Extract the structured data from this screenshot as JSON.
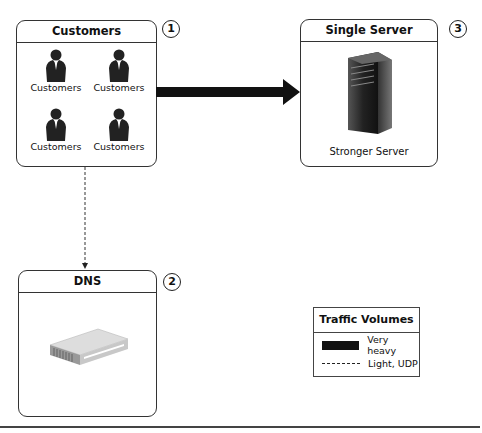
{
  "customers_box": {
    "title": "Customers",
    "badge": "1",
    "items": [
      {
        "label": "Customers",
        "icon": "person-silhouette-icon"
      },
      {
        "label": "Customers",
        "icon": "person-silhouette-icon"
      },
      {
        "label": "Customers",
        "icon": "person-silhouette-icon"
      },
      {
        "label": "Customers",
        "icon": "person-silhouette-icon"
      }
    ]
  },
  "server_box": {
    "title": "Single Server",
    "badge": "3",
    "label": "Stronger Server",
    "icon": "tower-server-icon"
  },
  "dns_box": {
    "title": "DNS",
    "badge": "2",
    "icon": "network-appliance-icon"
  },
  "connections": [
    {
      "from": "Customers",
      "to": "Single Server",
      "style": "very-heavy"
    },
    {
      "from": "Customers",
      "to": "DNS",
      "style": "light-udp"
    }
  ],
  "legend": {
    "title": "Traffic Volumes",
    "items": [
      {
        "label": "Very heavy",
        "style": "solid-thick"
      },
      {
        "label": "Light, UDP",
        "style": "dashed-thin"
      }
    ]
  },
  "colors": {
    "stroke": "#333333",
    "arrow": "#111111",
    "background": "#ffffff"
  }
}
